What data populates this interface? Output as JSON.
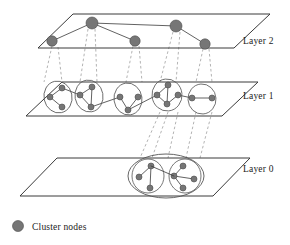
{
  "figure": {
    "type": "hierarchical-layered-network-diagram",
    "title": "",
    "background_color": "#ffffff",
    "colors": {
      "node_fill": "#767676",
      "node_stroke": "#4a4a4a",
      "edge": "#3a3a3a",
      "plane_stroke": "#3a3a3a",
      "projection_dashed": "#9a9a9a",
      "cluster_outline": "#555555",
      "text": "#1b1b1b"
    }
  },
  "layers": [
    {
      "id": "layer2",
      "label": "Layer 2",
      "label_position": {
        "x": 243,
        "y": 44
      },
      "plane": {
        "points": "38,48 73,14 270,14 234,48"
      },
      "nodes": [
        {
          "id": "L2-n1",
          "cx": 52,
          "cy": 41,
          "r": 5.2
        },
        {
          "id": "L2-n2",
          "cx": 92,
          "cy": 23,
          "r": 6.0
        },
        {
          "id": "L2-n3",
          "cx": 135,
          "cy": 41,
          "r": 5.2
        },
        {
          "id": "L2-n4",
          "cx": 176,
          "cy": 26,
          "r": 6.0
        },
        {
          "id": "L2-n5",
          "cx": 205,
          "cy": 44,
          "r": 5.2
        }
      ],
      "edges": [
        {
          "from": "L2-n1",
          "to": "L2-n2"
        },
        {
          "from": "L2-n2",
          "to": "L2-n3"
        },
        {
          "from": "L2-n2",
          "to": "L2-n4"
        },
        {
          "from": "L2-n4",
          "to": "L2-n5"
        }
      ]
    },
    {
      "id": "layer1",
      "label": "Layer 1",
      "label_position": {
        "x": 243,
        "y": 99
      },
      "plane": {
        "points": "26,116 62,82 258,82 222,116"
      },
      "clusters": [
        {
          "id": "L1-c1",
          "ellipse": {
            "cx": 58,
            "cy": 97,
            "rx": 14,
            "ry": 16,
            "rot": -12
          },
          "nodes": [
            {
              "id": "L1-c1-a",
              "cx": 62,
              "cy": 88,
              "r": 3.0
            },
            {
              "id": "L1-c1-b",
              "cx": 50,
              "cy": 97,
              "r": 3.0
            },
            {
              "id": "L1-c1-c",
              "cx": 62,
              "cy": 107,
              "r": 3.0
            }
          ],
          "edges": [
            [
              "L1-c1-a",
              "L1-c1-b"
            ],
            [
              "L1-c1-b",
              "L1-c1-c"
            ]
          ]
        },
        {
          "id": "L1-c2",
          "ellipse": {
            "cx": 89,
            "cy": 96,
            "rx": 14,
            "ry": 16,
            "rot": -10
          },
          "nodes": [
            {
              "id": "L1-c2-a",
              "cx": 92,
              "cy": 87,
              "r": 3.0
            },
            {
              "id": "L1-c2-b",
              "cx": 80,
              "cy": 95,
              "r": 3.0
            },
            {
              "id": "L1-c2-c",
              "cx": 91,
              "cy": 107,
              "r": 3.0
            }
          ],
          "edges": [
            [
              "L1-c2-a",
              "L1-c2-b"
            ],
            [
              "L1-c2-a",
              "L1-c2-c"
            ],
            [
              "L1-c2-b",
              "L1-c2-c"
            ]
          ]
        },
        {
          "id": "L1-c3",
          "ellipse": {
            "cx": 128,
            "cy": 99,
            "rx": 14,
            "ry": 16,
            "rot": -8
          },
          "nodes": [
            {
              "id": "L1-c3-a",
              "cx": 120,
              "cy": 97,
              "r": 3.0
            },
            {
              "id": "L1-c3-b",
              "cx": 138,
              "cy": 97,
              "r": 3.0
            },
            {
              "id": "L1-c3-c",
              "cx": 128,
              "cy": 110,
              "r": 3.0
            }
          ],
          "edges": [
            [
              "L1-c3-a",
              "L1-c3-c"
            ],
            [
              "L1-c3-b",
              "L1-c3-c"
            ]
          ]
        },
        {
          "id": "L1-c4",
          "ellipse": {
            "cx": 167,
            "cy": 95,
            "rx": 15,
            "ry": 16,
            "rot": -6
          },
          "nodes": [
            {
              "id": "L1-c4-a",
              "cx": 168,
              "cy": 85,
              "r": 3.0
            },
            {
              "id": "L1-c4-b",
              "cx": 157,
              "cy": 95,
              "r": 3.0
            },
            {
              "id": "L1-c4-c",
              "cx": 178,
              "cy": 95,
              "r": 3.0
            },
            {
              "id": "L1-c4-d",
              "cx": 167,
              "cy": 104,
              "r": 3.0
            }
          ],
          "edges": [
            [
              "L1-c4-a",
              "L1-c4-d"
            ],
            [
              "L1-c4-b",
              "L1-c4-d"
            ],
            [
              "L1-c4-c",
              "L1-c4-d"
            ],
            [
              "L1-c4-a",
              "L1-c4-b"
            ]
          ]
        },
        {
          "id": "L1-c5",
          "ellipse": {
            "cx": 202,
            "cy": 99,
            "rx": 14,
            "ry": 15,
            "rot": -4
          },
          "nodes": [
            {
              "id": "L1-c5-a",
              "cx": 192,
              "cy": 98,
              "r": 3.0
            },
            {
              "id": "L1-c5-b",
              "cx": 212,
              "cy": 98,
              "r": 3.0
            }
          ],
          "edges": [
            [
              "L1-c5-a",
              "L1-c5-b"
            ]
          ]
        }
      ],
      "inter_cluster_edges": [
        [
          "L1-c1-a",
          "L1-c2-b"
        ],
        [
          "L1-c2-c",
          "L1-c3-a"
        ],
        [
          "L1-c3-c",
          "L1-c4-b"
        ],
        [
          "L1-c4-c",
          "L1-c5-a"
        ]
      ]
    },
    {
      "id": "layer0",
      "label": "Layer 0",
      "label_position": {
        "x": 243,
        "y": 172
      },
      "plane": {
        "points": "20,196 57,158 250,158 213,196"
      },
      "clusters": [
        {
          "id": "L0-super",
          "ellipse": {
            "cx": 166,
            "cy": 176,
            "rx": 38,
            "ry": 22,
            "rot": 0
          },
          "subclusters": [
            {
              "id": "L0-c1",
              "ellipse": {
                "cx": 148,
                "cy": 176,
                "rx": 16,
                "ry": 17,
                "rot": 0
              },
              "nodes": [
                {
                  "id": "L0-c1-a",
                  "cx": 151,
                  "cy": 166,
                  "r": 3.0
                },
                {
                  "id": "L0-c1-b",
                  "cx": 139,
                  "cy": 177,
                  "r": 3.0
                },
                {
                  "id": "L0-c1-c",
                  "cx": 150,
                  "cy": 188,
                  "r": 3.0
                }
              ],
              "edges": [
                [
                  "L0-c1-a",
                  "L0-c1-b"
                ],
                [
                  "L0-c1-a",
                  "L0-c1-c"
                ]
              ]
            },
            {
              "id": "L0-c2",
              "ellipse": {
                "cx": 185,
                "cy": 176,
                "rx": 16,
                "ry": 17,
                "rot": 0
              },
              "nodes": [
                {
                  "id": "L0-c2-a",
                  "cx": 183,
                  "cy": 166,
                  "r": 3.0
                },
                {
                  "id": "L0-c2-b",
                  "cx": 174,
                  "cy": 176,
                  "r": 3.0
                },
                {
                  "id": "L0-c2-c",
                  "cx": 194,
                  "cy": 179,
                  "r": 3.0
                },
                {
                  "id": "L0-c2-d",
                  "cx": 183,
                  "cy": 188,
                  "r": 3.0
                }
              ],
              "edges": [
                [
                  "L0-c2-a",
                  "L0-c2-b"
                ],
                [
                  "L0-c2-b",
                  "L0-c2-c"
                ],
                [
                  "L0-c2-b",
                  "L0-c2-d"
                ]
              ]
            }
          ],
          "bridge_edges": [
            [
              "L0-c1-a",
              "L0-c2-b"
            ]
          ]
        }
      ]
    }
  ],
  "projections": {
    "layer2_to_layer1": [
      {
        "x1": 52,
        "y1": 46,
        "x2": 44,
        "y2": 82
      },
      {
        "x1": 58,
        "y1": 47,
        "x2": 62,
        "y2": 82
      },
      {
        "x1": 88,
        "y1": 29,
        "x2": 80,
        "y2": 82
      },
      {
        "x1": 95,
        "y1": 29,
        "x2": 97,
        "y2": 82
      },
      {
        "x1": 133,
        "y1": 46,
        "x2": 126,
        "y2": 82
      },
      {
        "x1": 139,
        "y1": 46,
        "x2": 142,
        "y2": 82
      },
      {
        "x1": 173,
        "y1": 32,
        "x2": 160,
        "y2": 82
      },
      {
        "x1": 180,
        "y1": 32,
        "x2": 176,
        "y2": 82
      },
      {
        "x1": 203,
        "y1": 49,
        "x2": 196,
        "y2": 82
      },
      {
        "x1": 209,
        "y1": 49,
        "x2": 212,
        "y2": 82
      }
    ],
    "layer1_to_layer0": [
      {
        "x1": 160,
        "y1": 112,
        "x2": 140,
        "y2": 158
      },
      {
        "x1": 168,
        "y1": 112,
        "x2": 152,
        "y2": 158
      },
      {
        "x1": 178,
        "y1": 112,
        "x2": 168,
        "y2": 158
      },
      {
        "x1": 196,
        "y1": 112,
        "x2": 186,
        "y2": 158
      },
      {
        "x1": 212,
        "y1": 112,
        "x2": 200,
        "y2": 158
      }
    ]
  },
  "legend": {
    "items": [
      {
        "id": "cluster-nodes",
        "label": "Cluster nodes",
        "marker": {
          "cx": 18,
          "cy": 226,
          "r": 5.5
        },
        "marker_color": "#767676",
        "label_position": {
          "x": 32,
          "y": 230
        }
      }
    ]
  }
}
